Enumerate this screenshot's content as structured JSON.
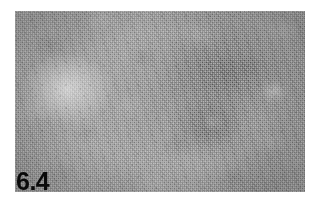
{
  "figure": {
    "number_label": "6.4",
    "plate": {
      "name": "histological-micrograph",
      "modality": "light-microscopy",
      "staining": "grayscale",
      "description": "Low-power grayscale photomicrograph of lymphoid tissue showing dense speckled cellular background with a pale ovoid region at left and darker diffuse zones toward the right, including a small pale nodule in the lower right-of-centre.",
      "colors": {
        "background_page": "#ffffff",
        "tissue_mid_tone": "#9e9e9e",
        "tissue_light_tone": "#d2d2d2",
        "tissue_dark_tone": "#6e6e6e",
        "label_text": "#0a0a0a"
      },
      "features": [
        {
          "name": "pale-ovoid-region",
          "position": "left-centre"
        },
        {
          "name": "dark-diffuse-zone",
          "position": "upper-right"
        },
        {
          "name": "dark-diffuse-zone-lower",
          "position": "lower-centre-right"
        },
        {
          "name": "pale-nodule",
          "position": "lower-centre-right"
        },
        {
          "name": "pale-focus",
          "position": "right-edge-upper"
        }
      ]
    }
  }
}
